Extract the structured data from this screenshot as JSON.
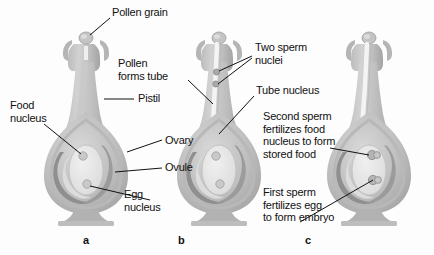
{
  "figure": {
    "background_color": "#fdfdfd",
    "text_color": "#111111"
  },
  "palette": {
    "pistil_light": "#c9c9c9",
    "pistil_mid": "#b0b0b0",
    "pistil_dark": "#8d8d8d",
    "pistil_darker": "#777777",
    "ovule_fill": "#e8e8e8",
    "nucleus_fill": "#d5d5d5",
    "outline": "#9a9a9a",
    "tube_light": "#f2f2f2"
  },
  "panels": [
    {
      "letter": "a",
      "caption": "Pollen grain lands on stigma; ovary contains ovule with food nucleus and egg nucleus"
    },
    {
      "letter": "b",
      "caption": "Pollen forms tube carrying tube nucleus and two sperm nuclei down the style"
    },
    {
      "letter": "c",
      "caption": "Double fertilization: one sperm fertilizes the egg, the other fertilizes the food nucleus"
    }
  ],
  "labels": [
    {
      "id": "pollen-grain",
      "text": "Pollen grain"
    },
    {
      "id": "pistil",
      "text": "Pistil"
    },
    {
      "id": "food-nucleus",
      "text": "Food\nnucleus"
    },
    {
      "id": "ovary",
      "text": "Ovary"
    },
    {
      "id": "ovule",
      "text": "Ovule"
    },
    {
      "id": "egg-nucleus",
      "text": "Egg\nnucleus"
    },
    {
      "id": "pollen-forms-tube",
      "text": "Pollen\nforms tube"
    },
    {
      "id": "two-sperm-nuclei",
      "text": "Two sperm\nnuclei"
    },
    {
      "id": "tube-nucleus",
      "text": "Tube  nucleus"
    },
    {
      "id": "second-sperm",
      "text": "Second sperm\nfertilizes food\nnucleus to form\nstored food"
    },
    {
      "id": "first-sperm",
      "text": "First sperm\nfertilizes egg\nto form embryo"
    }
  ]
}
